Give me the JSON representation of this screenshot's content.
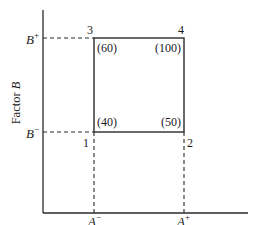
{
  "diagram": {
    "axes": {
      "x_label_prefix": "Factor ",
      "x_label_var": "A",
      "y_label_prefix": "Factor ",
      "y_label_var": "B"
    },
    "ticks": {
      "a_minus": {
        "var": "A",
        "sup": "−"
      },
      "a_plus": {
        "var": "A",
        "sup": "+"
      },
      "b_minus": {
        "var": "B",
        "sup": "−"
      },
      "b_plus": {
        "var": "B",
        "sup": "+"
      }
    },
    "corners": [
      {
        "id": "1",
        "value": "(40)"
      },
      {
        "id": "2",
        "value": "(50)"
      },
      {
        "id": "3",
        "value": "(60)"
      },
      {
        "id": "4",
        "value": "(100)"
      }
    ],
    "colors": {
      "line": "#2a2a2a",
      "text": "#1a1a1a",
      "background": "#ffffff"
    }
  }
}
